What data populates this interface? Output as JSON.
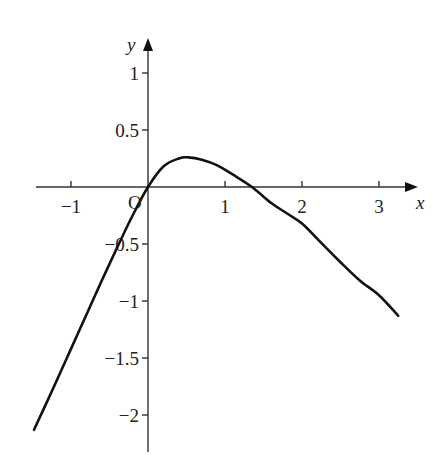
{
  "chart_data": {
    "type": "line",
    "title": "",
    "xlabel": "x",
    "ylabel": "y",
    "origin_label": "O",
    "xlim": [
      -1.48,
      3.5
    ],
    "ylim": [
      -2.3,
      1.35
    ],
    "grid": false,
    "legend": null,
    "x_ticks": [
      -1,
      1,
      2,
      3
    ],
    "x_tick_labels": [
      "−1",
      "1",
      "2",
      "3"
    ],
    "y_ticks": [
      1,
      0.5,
      -0.5,
      -1,
      -1.5,
      -2
    ],
    "y_tick_labels": [
      "1",
      "0.5",
      "−0.5",
      "−1",
      "−1.5",
      "−2"
    ],
    "series": [
      {
        "name": "curve",
        "color": "#111111",
        "x": [
          -1.48,
          -1.2,
          -1.0,
          -0.8,
          -0.6,
          -0.4,
          -0.2,
          0.0,
          0.2,
          0.4,
          0.52,
          0.7,
          0.9,
          1.1,
          1.35,
          1.6,
          1.8,
          2.0,
          2.25,
          2.5,
          2.75,
          3.0,
          3.25
        ],
        "y": [
          -2.13,
          -1.72,
          -1.42,
          -1.12,
          -0.82,
          -0.53,
          -0.25,
          0.0,
          0.18,
          0.25,
          0.26,
          0.24,
          0.19,
          0.11,
          0.0,
          -0.14,
          -0.23,
          -0.32,
          -0.49,
          -0.66,
          -0.82,
          -0.95,
          -1.13
        ]
      }
    ]
  },
  "layout": {
    "origin_px": [
      148,
      187
    ],
    "x_px_per_unit": 77,
    "y_px_per_unit": 114,
    "x_axis_px": [
      36,
      418
    ],
    "y_axis_px": [
      38,
      452
    ]
  }
}
